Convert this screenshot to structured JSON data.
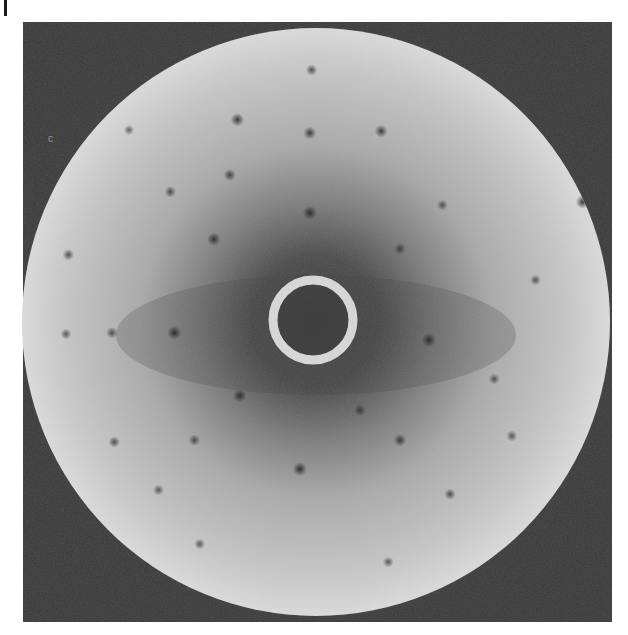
{
  "figure": {
    "panel_label": "I",
    "colors": {
      "frame": "#3a3a3a",
      "screen_edge": "#e6e6e6",
      "screen_mid": "#a8a8a8",
      "screen_center": "#4a4a4a",
      "ring": "#d8d8d8",
      "spot": "#2e2e2e"
    },
    "corner_mark": "c"
  },
  "spots": [
    {
      "x": 0.364,
      "y": 0.163,
      "s": 0.9
    },
    {
      "x": 0.487,
      "y": 0.185,
      "s": 0.8
    },
    {
      "x": 0.608,
      "y": 0.182,
      "s": 0.8
    },
    {
      "x": 0.351,
      "y": 0.255,
      "s": 0.7
    },
    {
      "x": 0.487,
      "y": 0.318,
      "s": 1.0
    },
    {
      "x": 0.324,
      "y": 0.362,
      "s": 0.9
    },
    {
      "x": 0.25,
      "y": 0.283,
      "s": 0.6
    },
    {
      "x": 0.64,
      "y": 0.378,
      "s": 0.6
    },
    {
      "x": 0.257,
      "y": 0.518,
      "s": 1.0
    },
    {
      "x": 0.689,
      "y": 0.53,
      "s": 1.0
    },
    {
      "x": 0.151,
      "y": 0.518,
      "s": 0.6
    },
    {
      "x": 0.073,
      "y": 0.52,
      "s": 0.5
    },
    {
      "x": 0.368,
      "y": 0.623,
      "s": 0.9
    },
    {
      "x": 0.47,
      "y": 0.745,
      "s": 1.0
    },
    {
      "x": 0.64,
      "y": 0.697,
      "s": 0.8
    },
    {
      "x": 0.572,
      "y": 0.647,
      "s": 0.6
    },
    {
      "x": 0.291,
      "y": 0.697,
      "s": 0.6
    },
    {
      "x": 0.725,
      "y": 0.787,
      "s": 0.6
    },
    {
      "x": 0.077,
      "y": 0.388,
      "s": 0.6
    },
    {
      "x": 0.95,
      "y": 0.3,
      "s": 0.9
    },
    {
      "x": 0.712,
      "y": 0.305,
      "s": 0.5
    },
    {
      "x": 0.155,
      "y": 0.7,
      "s": 0.6
    },
    {
      "x": 0.23,
      "y": 0.78,
      "s": 0.5
    },
    {
      "x": 0.8,
      "y": 0.595,
      "s": 0.5
    },
    {
      "x": 0.87,
      "y": 0.43,
      "s": 0.5
    },
    {
      "x": 0.49,
      "y": 0.08,
      "s": 0.6
    },
    {
      "x": 0.3,
      "y": 0.87,
      "s": 0.5
    },
    {
      "x": 0.62,
      "y": 0.9,
      "s": 0.5
    },
    {
      "x": 0.83,
      "y": 0.69,
      "s": 0.5
    },
    {
      "x": 0.18,
      "y": 0.18,
      "s": 0.4
    }
  ]
}
